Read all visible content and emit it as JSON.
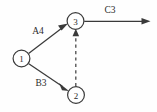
{
  "diagram": {
    "type": "network-diagram",
    "background_color": "#fefefe",
    "line_color": "#3a3a3a",
    "text_color": "#2b2b2b",
    "nodes": [
      {
        "id": "1",
        "label": "1",
        "cx": 21.5,
        "cy": 58.5,
        "r": 8.5
      },
      {
        "id": "2",
        "label": "2",
        "cx": 76.0,
        "cy": 95.0,
        "r": 8.5
      },
      {
        "id": "3",
        "label": "3",
        "cx": 75.5,
        "cy": 21.0,
        "r": 8.5
      }
    ],
    "edges": [
      {
        "id": "edge-1-3",
        "from": "1",
        "to": "3",
        "label": "A4",
        "style": "solid",
        "arrowhead": true,
        "label_x": 38,
        "label_y": 31
      },
      {
        "id": "edge-1-2",
        "from": "1",
        "to": "2",
        "label": "B3",
        "style": "solid",
        "arrowhead": true,
        "label_x": 41,
        "label_y": 83
      },
      {
        "id": "edge-2-3",
        "from": "2",
        "to": "3",
        "label": "",
        "style": "dashed",
        "arrowhead": true,
        "label_x": 0,
        "label_y": 0
      },
      {
        "id": "edge-3-out",
        "from": "3",
        "to": "",
        "label": "C3",
        "style": "solid",
        "arrowhead": true,
        "label_x": 110,
        "label_y": 10
      }
    ]
  }
}
